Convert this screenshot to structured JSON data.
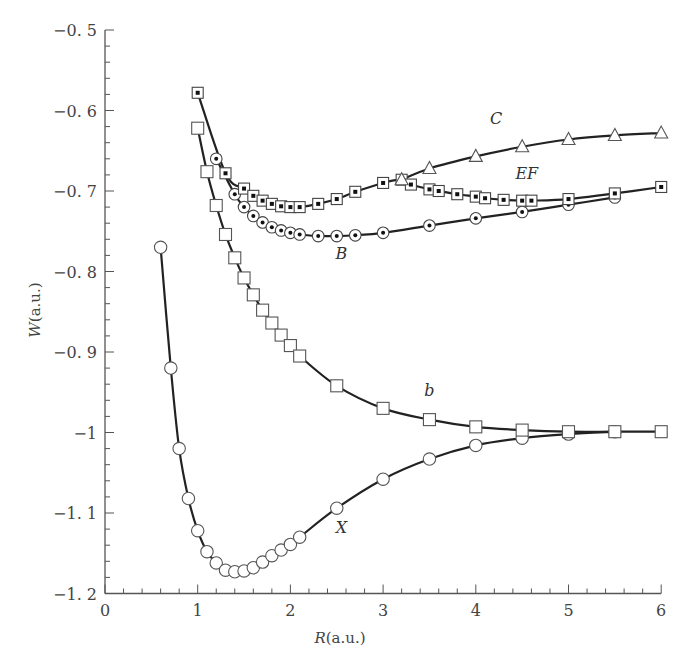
{
  "chart_data": {
    "type": "line",
    "title": "",
    "xlabel": "R(a.u.)",
    "ylabel": "W(a.u.)",
    "xlim": [
      0,
      6
    ],
    "ylim": [
      -1.2,
      -0.5
    ],
    "grid": false,
    "legend": "none (curves labeled inline)",
    "x_ticks": [
      "0",
      "1",
      "2",
      "3",
      "4",
      "5",
      "6"
    ],
    "y_ticks": [
      "-0.5",
      "-0.6",
      "-0.7",
      "-0.8",
      "-0.9",
      "-1",
      "-1.1",
      "-1.2"
    ],
    "series": [
      {
        "name": "X",
        "marker": "open-circle",
        "label_pos": [
          2.55,
          -1.125
        ],
        "x": [
          0.6,
          0.71,
          0.8,
          0.9,
          1.0,
          1.1,
          1.2,
          1.3,
          1.4,
          1.5,
          1.6,
          1.7,
          1.8,
          1.9,
          2.0,
          2.1,
          2.5,
          3.0,
          3.5,
          4.0,
          4.5,
          5.0,
          5.5
        ],
        "values": [
          -0.77,
          -0.92,
          -1.02,
          -1.082,
          -1.122,
          -1.148,
          -1.162,
          -1.171,
          -1.173,
          -1.172,
          -1.168,
          -1.161,
          -1.153,
          -1.146,
          -1.139,
          -1.13,
          -1.094,
          -1.058,
          -1.033,
          -1.016,
          -1.007,
          -1.002,
          -0.999
        ]
      },
      {
        "name": "b",
        "marker": "open-square",
        "label_pos": [
          3.5,
          -0.955
        ],
        "x": [
          1.0,
          1.1,
          1.2,
          1.3,
          1.4,
          1.5,
          1.6,
          1.7,
          1.8,
          1.9,
          2.0,
          2.1,
          2.5,
          3.0,
          3.5,
          4.0,
          4.5,
          5.0,
          5.5,
          6.0
        ],
        "values": [
          -0.622,
          -0.676,
          -0.718,
          -0.754,
          -0.783,
          -0.808,
          -0.829,
          -0.848,
          -0.864,
          -0.879,
          -0.892,
          -0.905,
          -0.942,
          -0.97,
          -0.984,
          -0.993,
          -0.997,
          -0.999,
          -0.999,
          -0.999
        ]
      },
      {
        "name": "B",
        "marker": "dotted-circle",
        "label_pos": [
          2.55,
          -0.785
        ],
        "x": [
          1.2,
          1.4,
          1.5,
          1.6,
          1.7,
          1.8,
          1.9,
          2.0,
          2.1,
          2.3,
          2.5,
          2.7,
          3.0,
          3.5,
          4.0,
          4.5,
          5.0,
          5.5
        ],
        "values": [
          -0.66,
          -0.704,
          -0.72,
          -0.731,
          -0.739,
          -0.745,
          -0.749,
          -0.752,
          -0.754,
          -0.756,
          -0.756,
          -0.755,
          -0.752,
          -0.743,
          -0.734,
          -0.726,
          -0.717,
          -0.708
        ]
      },
      {
        "name": "EF",
        "marker": "dotted-square",
        "label_pos": [
          4.55,
          -0.685
        ],
        "x": [
          1.0,
          1.3,
          1.5,
          1.6,
          1.7,
          1.8,
          1.9,
          2.0,
          2.1,
          2.3,
          2.5,
          2.7,
          3.0,
          3.2,
          3.3,
          3.5,
          3.6,
          3.8,
          4.0,
          4.1,
          4.3,
          4.5,
          4.6,
          5.0,
          5.5,
          6.0
        ],
        "values": [
          -0.578,
          -0.678,
          -0.697,
          -0.706,
          -0.712,
          -0.716,
          -0.719,
          -0.72,
          -0.72,
          -0.716,
          -0.71,
          -0.701,
          -0.69,
          -0.686,
          -0.692,
          -0.698,
          -0.7,
          -0.704,
          -0.707,
          -0.709,
          -0.711,
          -0.712,
          -0.712,
          -0.71,
          -0.703,
          -0.695
        ]
      },
      {
        "name": "C",
        "marker": "open-triangle",
        "label_pos": [
          4.22,
          -0.617
        ],
        "x": [
          3.2,
          3.5,
          4.0,
          4.5,
          5.0,
          5.5,
          6.0
        ],
        "values": [
          -0.686,
          -0.672,
          -0.657,
          -0.645,
          -0.636,
          -0.631,
          -0.628
        ]
      }
    ]
  }
}
